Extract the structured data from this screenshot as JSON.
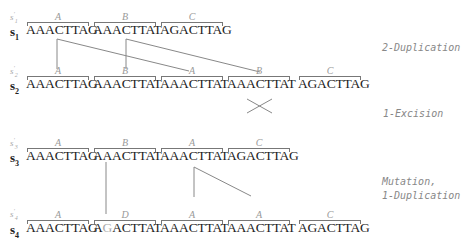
{
  "rows": [
    {
      "label": "s",
      "index": "1",
      "prime": "s'1",
      "segments": [
        {
          "tag": "A",
          "dna": "AAACTTAG"
        },
        {
          "tag": "B",
          "dna": "AAACTTAT"
        },
        {
          "tag": "C",
          "dna": "AGACTTAG"
        }
      ]
    },
    {
      "label": "s",
      "index": "2",
      "prime": "s'2",
      "segments": [
        {
          "tag": "A",
          "dna": "AAACTTAG"
        },
        {
          "tag": "B",
          "dna": "AAACTTAT"
        },
        {
          "tag": "A",
          "dna": "AAACTTAT"
        },
        {
          "tag": "B",
          "dna": "AAACTTAT"
        },
        {
          "tag": "C",
          "dna": "AGACTTAG"
        }
      ]
    },
    {
      "label": "s",
      "index": "3",
      "prime": "s'3",
      "segments": [
        {
          "tag": "A",
          "dna": "AAACTTAG"
        },
        {
          "tag": "B",
          "dna": "AAACTTAT"
        },
        {
          "tag": "A",
          "dna": "AAACTTAT"
        },
        {
          "tag": "C",
          "dna": "AGACTTAG"
        }
      ]
    },
    {
      "label": "s",
      "index": "4",
      "prime": "s'4",
      "segments": [
        {
          "tag": "A",
          "dna": "AAACTTAG"
        },
        {
          "tag": "D",
          "dna_pre": "A",
          "dna_mut": "G",
          "dna_post": "ACTTAT"
        },
        {
          "tag": "A",
          "dna": "AAACTTAT"
        },
        {
          "tag": "A",
          "dna": "AAACTTAT"
        },
        {
          "tag": "C",
          "dna": "AGACTTAG"
        }
      ]
    }
  ],
  "events": [
    {
      "label": "2-Duplication"
    },
    {
      "label": "1-Excision"
    },
    {
      "line1": "Mutation,",
      "line2": "1-Duplication"
    }
  ],
  "colors": {
    "text": "#222222",
    "annotation": "#999999",
    "lines": "#888888",
    "mutation": "#aaaaaa"
  }
}
